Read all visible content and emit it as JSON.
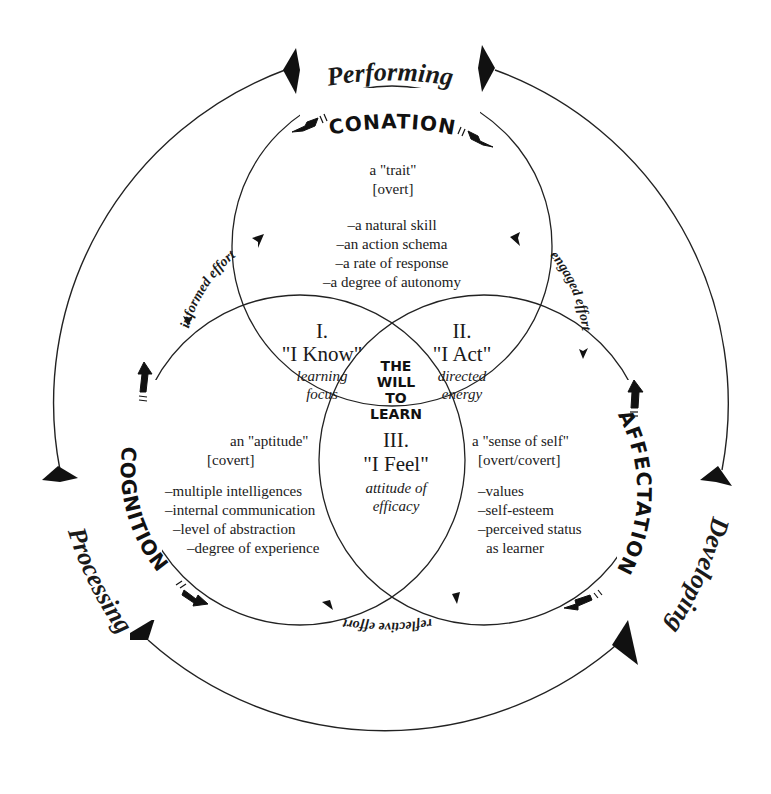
{
  "outer_cycle": {
    "top_label": "Performing",
    "left_label": "Processing",
    "right_label": "Developing"
  },
  "domains": {
    "conation": {
      "label": "CONATION",
      "type_line": "a \"trait\"",
      "visibility": "[overt]",
      "items": [
        "–a natural skill",
        "–an action schema",
        "–a rate of response",
        "–a degree of autonomy"
      ]
    },
    "cognition": {
      "label": "COGNITION",
      "type_line": "an \"aptitude\"",
      "visibility": "[covert]",
      "items": [
        "–multiple intelligences",
        "–internal communication",
        "–level of abstraction",
        "–degree of experience"
      ]
    },
    "affectation": {
      "label": "AFFECTATION",
      "type_line": "a \"sense of self\"",
      "visibility": "[overt/covert]",
      "items": [
        "–values",
        "–self-esteem",
        "–perceived status",
        "as learner"
      ]
    }
  },
  "intersections": {
    "one": {
      "numeral": "I.",
      "title": "\"I Know\"",
      "line1": "learning",
      "line2": "focus"
    },
    "two": {
      "numeral": "II.",
      "title": "\"I Act\"",
      "line1": "directed",
      "line2": "energy"
    },
    "three": {
      "numeral": "III.",
      "title": "\"I Feel\"",
      "line1": "attitude of",
      "line2": "efficacy"
    }
  },
  "center": {
    "lines": [
      "THE",
      "WILL",
      "TO",
      "LEARN"
    ]
  },
  "efforts": {
    "informed": "informed effort",
    "engaged": "engaged effort",
    "reflective": "reflective effort"
  },
  "colors": {
    "ink": "#1a1a1a",
    "background": "#ffffff"
  }
}
